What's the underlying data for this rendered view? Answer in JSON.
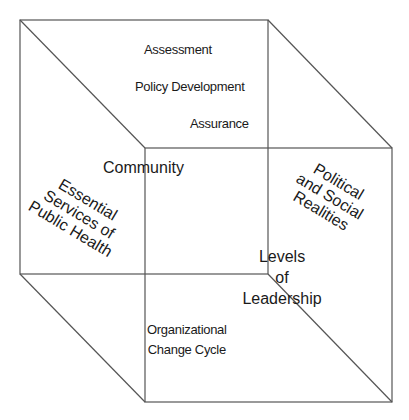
{
  "diagram": {
    "type": "cube",
    "stroke_color": "#555555",
    "front_face": {
      "x1": 20,
      "y1": 20,
      "x2": 268,
      "y2": 274
    },
    "back_face": {
      "x1": 145,
      "y1": 148,
      "x2": 392,
      "y2": 402
    }
  },
  "labels": {
    "assessment": "Assessment",
    "policy_development": "Policy Development",
    "assurance": "Assurance",
    "community": "Community",
    "essential_services": [
      "Essential",
      "Services of",
      "Public Health"
    ],
    "political_social": [
      "Political",
      "and Social",
      "Realities"
    ],
    "levels_of_leadership": [
      "Levels",
      "of",
      "Leadership"
    ],
    "organizational_change": [
      "Organizational",
      "Change Cycle"
    ]
  }
}
